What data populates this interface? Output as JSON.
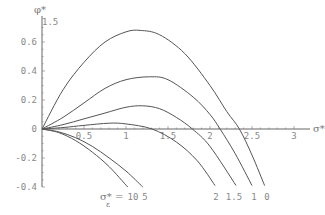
{
  "chart_data": {
    "type": "line",
    "title": "",
    "xlabel": "σ*",
    "ylabel": "φ*",
    "y_axis_top_label": "1.5",
    "xlim": [
      0,
      3
    ],
    "ylim": [
      -0.4,
      0.7
    ],
    "grid": false,
    "legend": "inline curve labels at bottom",
    "x_ticks": [
      "0.5",
      "1",
      "1.5",
      "2",
      "2.5",
      "3"
    ],
    "y_ticks": [
      {
        "value": 0.6,
        "label": "0.6"
      },
      {
        "value": 0.4,
        "label": "0.4"
      },
      {
        "value": 0.2,
        "label": "0.2"
      },
      {
        "value": 0,
        "label": "0"
      },
      {
        "value": -0.2,
        "label": "-0.2"
      },
      {
        "value": -0.4,
        "label": "-0.4"
      }
    ],
    "curve_label_prefix": "σ*ε =",
    "series": [
      {
        "name": "0",
        "x": [
          0,
          0.25,
          0.5,
          0.75,
          1.0,
          1.17,
          1.4,
          1.7,
          2.0,
          2.2,
          2.35,
          2.5,
          2.65
        ],
        "y": [
          0,
          0.27,
          0.46,
          0.6,
          0.67,
          0.68,
          0.65,
          0.52,
          0.3,
          0.12,
          0,
          -0.18,
          -0.39
        ]
      },
      {
        "name": "1",
        "x": [
          0,
          0.25,
          0.5,
          0.75,
          1.0,
          1.28,
          1.5,
          1.8,
          2.0,
          2.12,
          2.3,
          2.5
        ],
        "y": [
          0,
          0.08,
          0.18,
          0.28,
          0.34,
          0.36,
          0.34,
          0.22,
          0.1,
          0,
          -0.17,
          -0.39
        ]
      },
      {
        "name": "1.5",
        "x": [
          0,
          0.25,
          0.5,
          0.75,
          1.0,
          1.2,
          1.4,
          1.6,
          1.79,
          2.0,
          2.31
        ],
        "y": [
          0,
          0.03,
          0.07,
          0.11,
          0.15,
          0.16,
          0.14,
          0.08,
          0,
          -0.12,
          -0.39
        ]
      },
      {
        "name": "2",
        "x": [
          0,
          0.25,
          0.5,
          0.8,
          1.0,
          1.31,
          1.6,
          1.85,
          2.06
        ],
        "y": [
          0,
          0.01,
          0.025,
          0.04,
          0.035,
          0,
          -0.09,
          -0.22,
          -0.39
        ]
      },
      {
        "name": "5",
        "x": [
          0,
          0.2,
          0.4,
          0.6,
          0.8,
          1.0,
          1.2
        ],
        "y": [
          0,
          -0.02,
          -0.06,
          -0.12,
          -0.2,
          -0.29,
          -0.4
        ]
      },
      {
        "name": "10",
        "x": [
          0,
          0.2,
          0.4,
          0.6,
          0.8,
          1.02
        ],
        "y": [
          0,
          -0.025,
          -0.08,
          -0.16,
          -0.26,
          -0.4
        ]
      }
    ]
  }
}
